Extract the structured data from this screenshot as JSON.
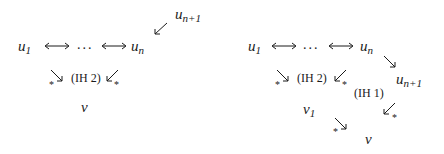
{
  "diagrams": [
    {
      "id": "left",
      "nodes": {
        "u1": {
          "base": "u",
          "sub": "1"
        },
        "dots": "...",
        "un": {
          "base": "u",
          "sub": "n"
        },
        "un1": {
          "base": "u",
          "sub": "n+1"
        },
        "v": {
          "base": "v",
          "sub": ""
        }
      },
      "labels": {
        "ih2": "(IH 2)"
      },
      "edges": [
        {
          "from": "u1",
          "to": "dots",
          "type": "bidirectional"
        },
        {
          "from": "dots",
          "to": "un",
          "type": "bidirectional"
        },
        {
          "from": "un1",
          "to": "un",
          "type": "single"
        },
        {
          "from": "u1",
          "to": "v",
          "type": "star",
          "mark": "*"
        },
        {
          "from": "un",
          "to": "v",
          "type": "star",
          "mark": "*"
        }
      ]
    },
    {
      "id": "right",
      "nodes": {
        "u1": {
          "base": "u",
          "sub": "1"
        },
        "dots": "...",
        "un": {
          "base": "u",
          "sub": "n"
        },
        "un1": {
          "base": "u",
          "sub": "n+1"
        },
        "v1": {
          "base": "v",
          "sub": "1"
        },
        "v": {
          "base": "v",
          "sub": ""
        }
      },
      "labels": {
        "ih2": "(IH 2)",
        "ih1": "(IH 1)"
      },
      "edges": [
        {
          "from": "u1",
          "to": "dots",
          "type": "bidirectional"
        },
        {
          "from": "dots",
          "to": "un",
          "type": "bidirectional"
        },
        {
          "from": "un",
          "to": "un1",
          "type": "single"
        },
        {
          "from": "u1",
          "to": "v1",
          "type": "star",
          "mark": "*"
        },
        {
          "from": "un",
          "to": "v1",
          "type": "star",
          "mark": "*"
        },
        {
          "from": "un1",
          "to": "v",
          "type": "star",
          "mark": "*"
        },
        {
          "from": "v1",
          "to": "v",
          "type": "star",
          "mark": "*"
        }
      ]
    }
  ],
  "marks": {
    "star": "*"
  }
}
